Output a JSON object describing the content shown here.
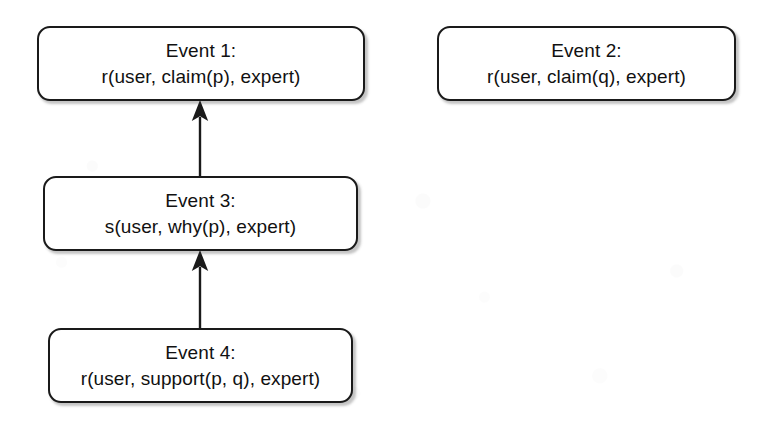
{
  "diagram": {
    "background_color": "#ffffff",
    "box_border_color": "#1a1a1a",
    "text_color": "#111111",
    "arrow_color": "#1a1a1a",
    "nodes": [
      {
        "id": "event-1",
        "title": "Event 1:",
        "body": "r(user, claim(p), expert)",
        "x": 37,
        "y": 26,
        "width": 328,
        "height": 75
      },
      {
        "id": "event-2",
        "title": "Event 2:",
        "body": "r(user, claim(q), expert)",
        "x": 437,
        "y": 26,
        "width": 299,
        "height": 75
      },
      {
        "id": "event-3",
        "title": "Event 3:",
        "body": "s(user, why(p), expert)",
        "x": 43,
        "y": 176,
        "width": 315,
        "height": 75
      },
      {
        "id": "event-4",
        "title": "Event 4:",
        "body": "r(user, support(p, q), expert)",
        "x": 48,
        "y": 328,
        "width": 305,
        "height": 75
      }
    ],
    "edges": [
      {
        "id": "edge-3-to-1",
        "from": "event-3",
        "to": "event-1",
        "direction": "up",
        "x": 200,
        "y_top": 101,
        "y_bottom": 176
      },
      {
        "id": "edge-4-to-3",
        "from": "event-4",
        "to": "event-3",
        "direction": "up",
        "x": 200,
        "y_top": 251,
        "y_bottom": 328
      }
    ]
  }
}
